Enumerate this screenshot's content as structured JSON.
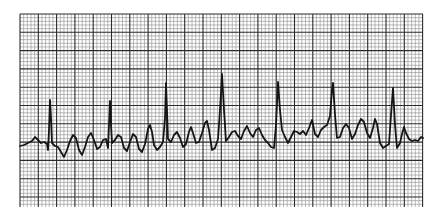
{
  "strip": {
    "grid": {
      "x0": 20,
      "y0": 14,
      "x1": 423,
      "y1": 207,
      "minor_step": 3.66,
      "major_every": 5,
      "minor_color": "#9a9a9a",
      "major_color": "#2a2a2a",
      "background": "#ffffff"
    },
    "trace": {
      "color": "#151515",
      "width": 1.8,
      "points": [
        [
          20,
          146
        ],
        [
          24,
          145
        ],
        [
          28,
          143
        ],
        [
          32,
          141
        ],
        [
          35,
          137
        ],
        [
          38,
          140
        ],
        [
          41,
          143
        ],
        [
          44,
          142
        ],
        [
          47,
          144
        ],
        [
          48,
          150
        ],
        [
          49,
          130
        ],
        [
          50,
          100
        ],
        [
          51,
          118
        ],
        [
          52,
          143
        ],
        [
          55,
          146
        ],
        [
          58,
          147
        ],
        [
          61,
          152
        ],
        [
          64,
          157
        ],
        [
          67,
          150
        ],
        [
          70,
          141
        ],
        [
          73,
          135
        ],
        [
          76,
          138
        ],
        [
          79,
          150
        ],
        [
          82,
          155
        ],
        [
          85,
          147
        ],
        [
          88,
          137
        ],
        [
          91,
          133
        ],
        [
          94,
          140
        ],
        [
          97,
          149
        ],
        [
          100,
          147
        ],
        [
          103,
          140
        ],
        [
          106,
          139
        ],
        [
          108,
          148
        ],
        [
          109,
          125
        ],
        [
          110,
          101
        ],
        [
          111,
          125
        ],
        [
          112,
          143
        ],
        [
          115,
          140
        ],
        [
          118,
          135
        ],
        [
          121,
          137
        ],
        [
          124,
          148
        ],
        [
          127,
          151
        ],
        [
          130,
          142
        ],
        [
          133,
          134
        ],
        [
          136,
          137
        ],
        [
          139,
          149
        ],
        [
          142,
          152
        ],
        [
          145,
          144
        ],
        [
          148,
          129
        ],
        [
          150,
          125
        ],
        [
          152,
          132
        ],
        [
          154,
          145
        ],
        [
          157,
          150
        ],
        [
          160,
          147
        ],
        [
          163,
          142
        ],
        [
          165,
          118
        ],
        [
          166,
          83
        ],
        [
          167,
          110
        ],
        [
          168,
          139
        ],
        [
          171,
          142
        ],
        [
          174,
          135
        ],
        [
          177,
          132
        ],
        [
          180,
          138
        ],
        [
          183,
          147
        ],
        [
          186,
          144
        ],
        [
          189,
          132
        ],
        [
          191,
          127
        ],
        [
          193,
          133
        ],
        [
          196,
          143
        ],
        [
          199,
          142
        ],
        [
          202,
          133
        ],
        [
          205,
          123
        ],
        [
          207,
          121
        ],
        [
          209,
          130
        ],
        [
          212,
          150
        ],
        [
          215,
          148
        ],
        [
          218,
          139
        ],
        [
          220,
          110
        ],
        [
          222,
          74
        ],
        [
          224,
          110
        ],
        [
          226,
          141
        ],
        [
          229,
          137
        ],
        [
          232,
          132
        ],
        [
          235,
          131
        ],
        [
          238,
          136
        ],
        [
          241,
          139
        ],
        [
          244,
          131
        ],
        [
          247,
          126
        ],
        [
          250,
          133
        ],
        [
          253,
          137
        ],
        [
          256,
          130
        ],
        [
          259,
          128
        ],
        [
          262,
          135
        ],
        [
          265,
          140
        ],
        [
          268,
          143
        ],
        [
          271,
          147
        ],
        [
          274,
          148
        ],
        [
          276,
          125
        ],
        [
          278,
          82
        ],
        [
          280,
          110
        ],
        [
          282,
          130
        ],
        [
          285,
          137
        ],
        [
          288,
          143
        ],
        [
          291,
          137
        ],
        [
          294,
          131
        ],
        [
          297,
          132
        ],
        [
          300,
          134
        ],
        [
          303,
          131
        ],
        [
          306,
          135
        ],
        [
          309,
          128
        ],
        [
          312,
          120
        ],
        [
          315,
          134
        ],
        [
          318,
          137
        ],
        [
          321,
          130
        ],
        [
          324,
          127
        ],
        [
          327,
          125
        ],
        [
          330,
          116
        ],
        [
          332,
          90
        ],
        [
          333,
          83
        ],
        [
          335,
          115
        ],
        [
          337,
          138
        ],
        [
          340,
          137
        ],
        [
          343,
          128
        ],
        [
          346,
          124
        ],
        [
          349,
          128
        ],
        [
          352,
          139
        ],
        [
          355,
          134
        ],
        [
          358,
          125
        ],
        [
          361,
          119
        ],
        [
          364,
          122
        ],
        [
          367,
          133
        ],
        [
          370,
          138
        ],
        [
          373,
          128
        ],
        [
          375,
          119
        ],
        [
          377,
          124
        ],
        [
          380,
          143
        ],
        [
          383,
          148
        ],
        [
          386,
          146
        ],
        [
          389,
          144
        ],
        [
          391,
          115
        ],
        [
          393,
          88
        ],
        [
          395,
          125
        ],
        [
          397,
          148
        ],
        [
          400,
          143
        ],
        [
          402,
          134
        ],
        [
          404,
          127
        ],
        [
          406,
          133
        ],
        [
          409,
          139
        ],
        [
          412,
          141
        ],
        [
          415,
          140
        ],
        [
          418,
          141
        ],
        [
          421,
          137
        ],
        [
          423,
          138
        ]
      ]
    }
  }
}
